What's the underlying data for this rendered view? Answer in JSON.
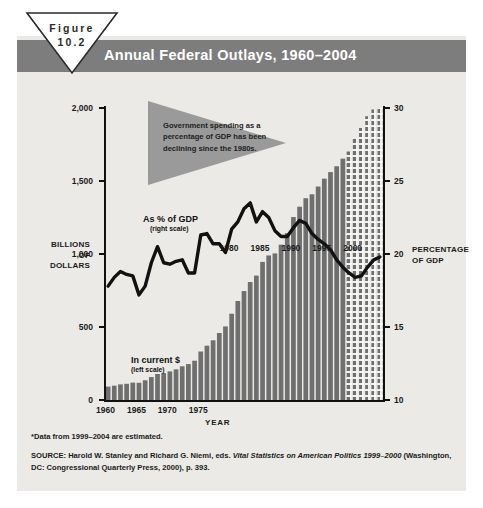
{
  "figure": {
    "badge_line1": "Figure",
    "badge_line2": "10.2"
  },
  "header": {
    "title": "Annual Federal Outlays, 1960–2004"
  },
  "callout": {
    "text": "Government spending as a percentage of GDP has been declining since the 1980s."
  },
  "series_labels": {
    "gdp_label": "As % of GDP",
    "gdp_sub": "(right scale)",
    "dollars_label": "In current $",
    "dollars_sub": "(left scale)"
  },
  "axes": {
    "left_title": "BILLIONS OF DOLLARS",
    "left_title_lines": [
      "BILLIONS",
      "OF",
      "DOLLARS"
    ],
    "right_title_lines": [
      "PERCENTAGE",
      "OF GDP"
    ],
    "x_title": "YEAR",
    "left_ticks": [
      "0",
      "500",
      "1,000",
      "1,500",
      "2,000"
    ],
    "right_ticks": [
      "10",
      "15",
      "20",
      "25",
      "30"
    ],
    "x_ticks": [
      "1960",
      "1965",
      "1970",
      "1975"
    ],
    "inline_year_labels": [
      "1980",
      "1985",
      "1990",
      "1995",
      "2000"
    ]
  },
  "footnote": {
    "estimate_note": "*Data from 1999–2004 are estimated."
  },
  "source": {
    "prefix": "SOURCE: Harold W. Stanley and Richard G. Niemi, eds. ",
    "italic": "Vital Statistics on American Politics 1999–2000",
    "suffix": " (Washington, DC: Congressional Quarterly Press, 2000), p. 393."
  },
  "colors": {
    "header_band": "#7d7d7d",
    "card_bg": "#eceae6",
    "bar": "#6f6f6f",
    "bar_estimated": "#6f6f6f",
    "line": "#111111",
    "callout": "#9a9a9a"
  },
  "chart_data": {
    "type": "bar",
    "title": "Annual Federal Outlays, 1960–2004",
    "xlabel": "YEAR",
    "ylabel": "BILLIONS OF DOLLARS",
    "y2label": "PERCENTAGE OF GDP",
    "ylim": [
      0,
      2000
    ],
    "y2lim": [
      10,
      30
    ],
    "xlim": [
      1960,
      2004
    ],
    "grid": false,
    "legend": "inline annotations",
    "categories": [
      1960,
      1961,
      1962,
      1963,
      1964,
      1965,
      1966,
      1967,
      1968,
      1969,
      1970,
      1971,
      1972,
      1973,
      1974,
      1975,
      1976,
      1977,
      1978,
      1979,
      1980,
      1981,
      1982,
      1983,
      1984,
      1985,
      1986,
      1987,
      1988,
      1989,
      1990,
      1991,
      1992,
      1993,
      1994,
      1995,
      1996,
      1997,
      1998,
      1999,
      2000,
      2001,
      2002,
      2003,
      2004
    ],
    "series": [
      {
        "name": "In current $",
        "axis": "left",
        "units": "billions of dollars",
        "values": [
          92,
          98,
          107,
          111,
          119,
          118,
          135,
          157,
          178,
          184,
          196,
          210,
          231,
          246,
          269,
          332,
          372,
          409,
          459,
          504,
          591,
          678,
          746,
          808,
          852,
          946,
          990,
          1004,
          1064,
          1143,
          1253,
          1324,
          1382,
          1409,
          1462,
          1516,
          1561,
          1601,
          1653,
          1702,
          1790,
          1863,
          1944,
          1990,
          2010
        ],
        "estimated_from": 1999
      },
      {
        "name": "As % of GDP",
        "axis": "right",
        "units": "percent of GDP",
        "values": [
          17.8,
          18.4,
          18.8,
          18.6,
          18.5,
          17.2,
          17.8,
          19.4,
          20.5,
          19.4,
          19.3,
          19.5,
          19.6,
          18.7,
          18.7,
          21.3,
          21.4,
          20.7,
          20.7,
          20.1,
          21.7,
          22.2,
          23.1,
          23.5,
          22.2,
          22.9,
          22.5,
          21.6,
          21.2,
          21.2,
          21.8,
          22.3,
          22.1,
          21.4,
          21.0,
          20.7,
          20.3,
          19.6,
          19.1,
          18.7,
          18.4,
          18.5,
          19.1,
          19.6,
          19.8
        ],
        "estimated_from": 1999
      }
    ],
    "annotation": "Government spending as a percentage of GDP has been declining since the 1980s."
  }
}
